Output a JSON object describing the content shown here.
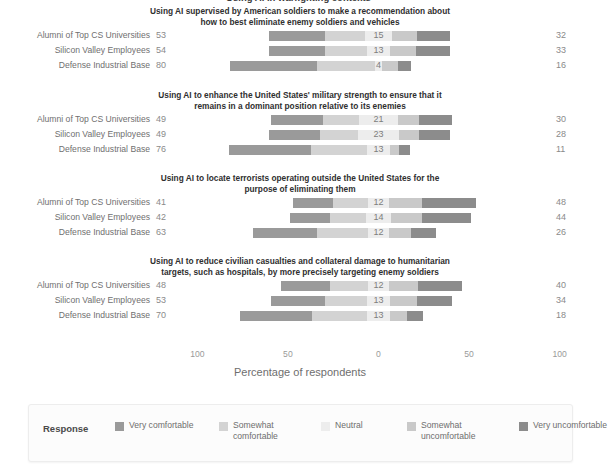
{
  "top_clipped_title": "Using AI in warfighting contexts",
  "axis": {
    "title": "Percentage of respondents",
    "ticks": [
      "100",
      "50",
      "0",
      "50",
      "100"
    ],
    "tick_values": [
      -100,
      -50,
      0,
      50,
      100
    ]
  },
  "legend": {
    "title": "Response",
    "items": [
      {
        "label": "Very comfortable",
        "color": "#9a9a9a"
      },
      {
        "label": "Somewhat comfortable",
        "color": "#d3d3d3"
      },
      {
        "label": "Neutral",
        "color": "#ededed"
      },
      {
        "label": "Somewhat uncomfortable",
        "color": "#c9c9c9"
      },
      {
        "label": "Very uncomfortable",
        "color": "#8c8c8c"
      }
    ]
  },
  "groups": [
    "Alumni of Top CS Universities",
    "Silicon Valley Employees",
    "Defense Industrial Base"
  ],
  "chart_data": {
    "type": "bar",
    "subtype": "diverging-stacked-likert",
    "title": "Using AI in warfighting contexts",
    "xlabel": "Percentage of respondents",
    "ylabel": "",
    "xlim": [
      -100,
      100
    ],
    "grid": false,
    "legend_position": "bottom",
    "categories": [
      "Alumni of Top CS Universities",
      "Silicon Valley Employees",
      "Defense Industrial Base"
    ],
    "response_levels": [
      "Very comfortable",
      "Somewhat comfortable",
      "Neutral",
      "Somewhat uncomfortable",
      "Very uncomfortable"
    ],
    "panels": [
      {
        "title": "Using AI supervised by American soldiers to make a recommendation about how to best eliminate enemy soldiers and vehicles",
        "rows": [
          {
            "group": "Alumni of Top CS Universities",
            "left_total": 53,
            "neutral": 15,
            "right_total": 32,
            "values": {
              "very_comfortable": 31,
              "somewhat_comfortable": 22,
              "neutral": 15,
              "somewhat_uncomfortable": 14,
              "very_uncomfortable": 18
            }
          },
          {
            "group": "Silicon Valley Employees",
            "left_total": 54,
            "neutral": 13,
            "right_total": 33,
            "values": {
              "very_comfortable": 31,
              "somewhat_comfortable": 23,
              "neutral": 13,
              "somewhat_uncomfortable": 14,
              "very_uncomfortable": 19
            }
          },
          {
            "group": "Defense Industrial Base",
            "left_total": 80,
            "neutral": 4,
            "right_total": 16,
            "values": {
              "very_comfortable": 48,
              "somewhat_comfortable": 32,
              "neutral": 4,
              "somewhat_uncomfortable": 9,
              "very_uncomfortable": 7
            }
          }
        ]
      },
      {
        "title": "Using AI to enhance the United States' military strength to ensure that it remains in a dominant position relative to its enemies",
        "rows": [
          {
            "group": "Alumni of Top CS Universities",
            "left_total": 49,
            "neutral": 21,
            "right_total": 30,
            "values": {
              "very_comfortable": 29,
              "somewhat_comfortable": 20,
              "neutral": 21,
              "somewhat_uncomfortable": 12,
              "very_uncomfortable": 18
            }
          },
          {
            "group": "Silicon Valley Employees",
            "left_total": 49,
            "neutral": 23,
            "right_total": 28,
            "values": {
              "very_comfortable": 28,
              "somewhat_comfortable": 21,
              "neutral": 23,
              "somewhat_uncomfortable": 11,
              "very_uncomfortable": 17
            }
          },
          {
            "group": "Defense Industrial Base",
            "left_total": 76,
            "neutral": 13,
            "right_total": 11,
            "values": {
              "very_comfortable": 45,
              "somewhat_comfortable": 31,
              "neutral": 13,
              "somewhat_uncomfortable": 5,
              "very_uncomfortable": 6
            }
          }
        ]
      },
      {
        "title": "Using AI to locate terrorists operating outside the United States for the purpose of eliminating them",
        "rows": [
          {
            "group": "Alumni of Top CS Universities",
            "left_total": 41,
            "neutral": 12,
            "right_total": 48,
            "values": {
              "very_comfortable": 22,
              "somewhat_comfortable": 19,
              "neutral": 12,
              "somewhat_uncomfortable": 18,
              "very_uncomfortable": 30
            }
          },
          {
            "group": "Silicon Valley Employees",
            "left_total": 42,
            "neutral": 14,
            "right_total": 44,
            "values": {
              "very_comfortable": 22,
              "somewhat_comfortable": 20,
              "neutral": 14,
              "somewhat_uncomfortable": 17,
              "very_uncomfortable": 27
            }
          },
          {
            "group": "Defense Industrial Base",
            "left_total": 63,
            "neutral": 12,
            "right_total": 26,
            "values": {
              "very_comfortable": 35,
              "somewhat_comfortable": 28,
              "neutral": 12,
              "somewhat_uncomfortable": 12,
              "very_uncomfortable": 14
            }
          }
        ]
      },
      {
        "title": "Using AI to reduce civilian casualties and collateral damage to humanitarian targets, such as hospitals, by more precisely targeting enemy soldiers",
        "rows": [
          {
            "group": "Alumni of Top CS Universities",
            "left_total": 48,
            "neutral": 12,
            "right_total": 40,
            "values": {
              "very_comfortable": 27,
              "somewhat_comfortable": 21,
              "neutral": 12,
              "somewhat_uncomfortable": 16,
              "very_uncomfortable": 24
            }
          },
          {
            "group": "Silicon Valley Employees",
            "left_total": 53,
            "neutral": 13,
            "right_total": 34,
            "values": {
              "very_comfortable": 30,
              "somewhat_comfortable": 23,
              "neutral": 13,
              "somewhat_uncomfortable": 15,
              "very_uncomfortable": 19
            }
          },
          {
            "group": "Defense Industrial Base",
            "left_total": 70,
            "neutral": 13,
            "right_total": 18,
            "values": {
              "very_comfortable": 40,
              "somewhat_comfortable": 30,
              "neutral": 13,
              "somewhat_uncomfortable": 9,
              "very_uncomfortable": 9
            }
          }
        ]
      }
    ]
  }
}
